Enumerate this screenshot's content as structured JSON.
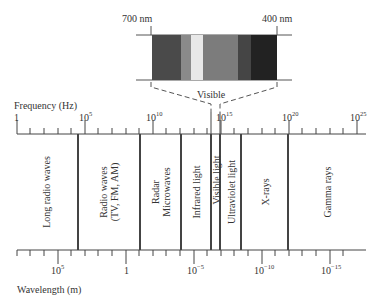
{
  "visible_inset": {
    "label_left": "700 nm",
    "label_right": "400 nm",
    "caption": "Visible",
    "bands": [
      "#4a4a4a",
      "#8a8a8a",
      "#e8e8e8",
      "#7c7c7c",
      "#454545",
      "#222222"
    ]
  },
  "frequency_axis": {
    "title": "Frequency (Hz)",
    "ticks": [
      {
        "base": "1",
        "exp": ""
      },
      {
        "base": "10",
        "exp": "5"
      },
      {
        "base": "10",
        "exp": "10"
      },
      {
        "base": "10",
        "exp": "15"
      },
      {
        "base": "10",
        "exp": "20"
      },
      {
        "base": "10",
        "exp": "25"
      }
    ]
  },
  "wavelength_axis": {
    "title": "Wavelength (m)",
    "ticks": [
      {
        "base": "10",
        "exp": "5"
      },
      {
        "base": "1",
        "exp": ""
      },
      {
        "base": "10",
        "exp": "−5"
      },
      {
        "base": "10",
        "exp": "−10"
      },
      {
        "base": "10",
        "exp": "−15"
      }
    ]
  },
  "regions": [
    {
      "label": "Long radio waves"
    },
    {
      "label": "Radio waves",
      "label2": "(TV, FM, AM)"
    },
    {
      "label": "Radar",
      "label2": "Microwaves"
    },
    {
      "label": "Infrared light"
    },
    {
      "label": "Visible light"
    },
    {
      "label": "Ultraviolet light"
    },
    {
      "label": "X-rays"
    },
    {
      "label": "Gamma rays"
    }
  ]
}
